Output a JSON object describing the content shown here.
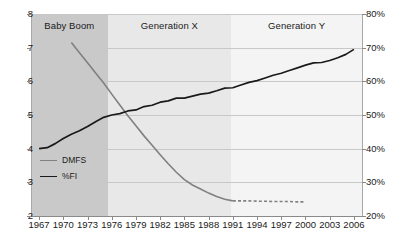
{
  "chart_data": {
    "type": "line",
    "title": "",
    "xlabel": "",
    "ylabel": "",
    "y2label": "",
    "grid": true,
    "legend_position": "inside-left",
    "x": [
      1967,
      1968,
      1969,
      1970,
      1971,
      1972,
      1973,
      1974,
      1975,
      1976,
      1977,
      1978,
      1979,
      1980,
      1981,
      1982,
      1983,
      1984,
      1985,
      1986,
      1987,
      1988,
      1989,
      1990,
      1991,
      1992,
      1993,
      1994,
      1995,
      1996,
      1997,
      1998,
      1999,
      2000,
      2001,
      2002,
      2003,
      2004,
      2005,
      2006
    ],
    "xlim": [
      1966,
      2007
    ],
    "ylim": [
      2,
      8
    ],
    "y2lim": [
      20,
      80
    ],
    "xticks": [
      1967,
      1970,
      1973,
      1976,
      1979,
      1982,
      1985,
      1988,
      1991,
      1994,
      1997,
      2000,
      2003,
      2006
    ],
    "yticks": [
      2,
      3,
      4,
      5,
      6,
      7,
      8
    ],
    "y2ticks": [
      "20%",
      "30%",
      "40%",
      "50%",
      "60%",
      "70%",
      "80%"
    ],
    "series": [
      {
        "name": "DMFS",
        "axis": "left",
        "color": "#808080",
        "style": "solid-then-dashed",
        "dash_from": 1991,
        "x": [
          1971,
          1972,
          1973,
          1974,
          1975,
          1976,
          1977,
          1978,
          1979,
          1980,
          1981,
          1982,
          1983,
          1984,
          1985,
          1986,
          1987,
          1988,
          1989,
          1990,
          1991,
          1992,
          1993,
          1994,
          1995,
          1996,
          1997,
          1998,
          1999,
          2000
        ],
        "values": [
          7.15,
          6.85,
          6.55,
          6.25,
          5.95,
          5.62,
          5.3,
          4.98,
          4.68,
          4.38,
          4.1,
          3.82,
          3.55,
          3.3,
          3.08,
          2.92,
          2.8,
          2.68,
          2.58,
          2.5,
          2.45,
          2.45,
          2.45,
          2.44,
          2.44,
          2.43,
          2.43,
          2.43,
          2.42,
          2.42
        ]
      },
      {
        "name": "%FI",
        "axis": "right",
        "color": "#1a1a1a",
        "style": "solid",
        "x": [
          1967,
          1968,
          1969,
          1970,
          1971,
          1972,
          1973,
          1974,
          1975,
          1976,
          1977,
          1978,
          1979,
          1980,
          1981,
          1982,
          1983,
          1984,
          1985,
          1986,
          1987,
          1988,
          1989,
          1990,
          1991,
          1992,
          1993,
          1994,
          1995,
          1996,
          1997,
          1998,
          1999,
          2000,
          2001,
          2002,
          2003,
          2004,
          2005,
          2006
        ],
        "values": [
          40.0,
          40.3,
          41.5,
          43.0,
          44.3,
          45.3,
          46.6,
          48.0,
          49.3,
          50.0,
          50.4,
          51.2,
          51.5,
          52.5,
          52.9,
          53.8,
          54.2,
          55.0,
          55.0,
          55.6,
          56.2,
          56.5,
          57.2,
          58.0,
          58.1,
          58.9,
          59.7,
          60.2,
          61.0,
          61.8,
          62.4,
          63.2,
          64.0,
          64.8,
          65.5,
          65.6,
          66.2,
          67.0,
          68.0,
          69.5
        ]
      }
    ],
    "bands": [
      {
        "label": "Baby Boom",
        "start": 1966,
        "end": 1975.5,
        "color": "#c9c9c9"
      },
      {
        "label": "Generation X",
        "start": 1975.5,
        "end": 1990.8,
        "color": "#e8e8e8"
      },
      {
        "label": "Generation Y",
        "start": 1990.8,
        "end": 2007,
        "color": "#f4f4f4"
      }
    ]
  },
  "legend": {
    "items": [
      {
        "label": "DMFS",
        "color": "#808080"
      },
      {
        "label": "%FI",
        "color": "#1a1a1a"
      }
    ]
  }
}
